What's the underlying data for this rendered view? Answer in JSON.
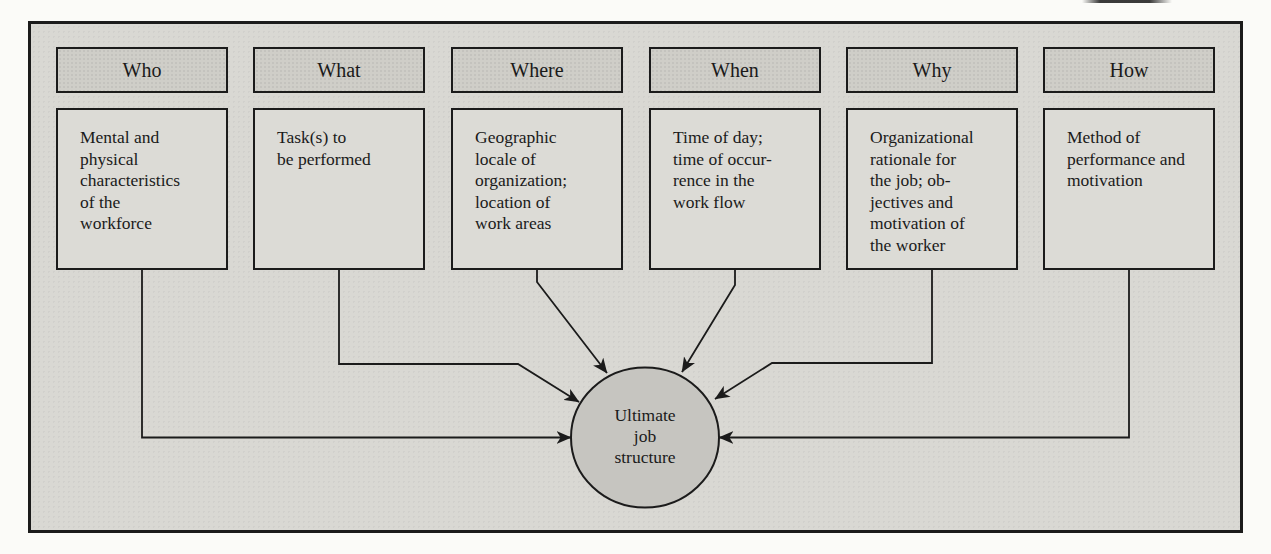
{
  "colors": {
    "page-bg": "#fbfbf8",
    "scan-bg": "#d9d8d3",
    "header-fill": "#cfcec8",
    "body-fill": "#dcdbd6",
    "circle-fill": "#c6c5c0",
    "line": "#1b1b1b",
    "text": "#1a1a1a"
  },
  "columns": [
    {
      "header": "Who",
      "body": "Mental and\nphysical\ncharacteristics\nof the\nworkforce"
    },
    {
      "header": "What",
      "body": "Task(s) to\nbe performed"
    },
    {
      "header": "Where",
      "body": "Geographic\nlocale of\norganization;\nlocation of\nwork areas"
    },
    {
      "header": "When",
      "body": "Time of day;\ntime of occur-\nrence in the\nwork flow"
    },
    {
      "header": "Why",
      "body": "Organizational\nrationale for\nthe job; ob-\njectives and\nmotivation of\nthe worker"
    },
    {
      "header": "How",
      "body": "Method of\nperformance and\nmotivation"
    }
  ],
  "center": {
    "label": "Ultimate\njob\nstructure"
  }
}
